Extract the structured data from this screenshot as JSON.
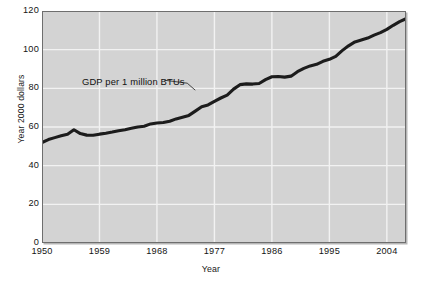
{
  "chart_data": {
    "type": "line",
    "title": "",
    "xlabel": "Year",
    "ylabel": "Year 2000 dollars",
    "xlim": [
      1950,
      2007
    ],
    "ylim": [
      0,
      120
    ],
    "grid": true,
    "legend": "none",
    "annotations": [
      {
        "text": "GDP per  1  million BTUs",
        "target_year": 1974,
        "target_value": 78
      }
    ],
    "xticks": [
      "1950",
      "1959",
      "1968",
      "1977",
      "1986",
      "1995",
      "2004"
    ],
    "xtick_values": [
      1950,
      1959,
      1968,
      1977,
      1986,
      1995,
      2004
    ],
    "yticks": [
      "0",
      "20",
      "40",
      "60",
      "80",
      "100",
      "120"
    ],
    "ytick_values": [
      0,
      20,
      40,
      60,
      80,
      100,
      120
    ],
    "series": [
      {
        "name": "GDP per 1 million BTUs",
        "color": "#1c1c1c",
        "x": [
          1950,
          1951,
          1952,
          1953,
          1954,
          1955,
          1956,
          1957,
          1958,
          1959,
          1960,
          1961,
          1962,
          1963,
          1964,
          1965,
          1966,
          1967,
          1968,
          1969,
          1970,
          1971,
          1972,
          1973,
          1974,
          1975,
          1976,
          1977,
          1978,
          1979,
          1980,
          1981,
          1982,
          1983,
          1984,
          1985,
          1986,
          1987,
          1988,
          1989,
          1990,
          1991,
          1992,
          1993,
          1994,
          1995,
          1996,
          1997,
          1998,
          1999,
          2000,
          2001,
          2002,
          2003,
          2004,
          2005,
          2006,
          2007
        ],
        "values": [
          52.0,
          53.5,
          54.5,
          55.5,
          56.3,
          58.6,
          56.6,
          55.8,
          55.7,
          56.3,
          56.8,
          57.4,
          58.1,
          58.6,
          59.3,
          60.0,
          60.4,
          61.6,
          62.1,
          62.3,
          63.0,
          64.2,
          65.1,
          66.0,
          68.2,
          70.5,
          71.4,
          73.3,
          75.0,
          76.5,
          79.6,
          81.9,
          82.3,
          82.2,
          82.5,
          84.5,
          86.0,
          86.1,
          85.8,
          86.3,
          88.6,
          90.3,
          91.6,
          92.4,
          94.0,
          95.0,
          96.5,
          99.5,
          102.0,
          104.0,
          105.0,
          106.0,
          107.5,
          108.8,
          110.5,
          112.6,
          114.5,
          116.0
        ]
      }
    ]
  },
  "axes": {
    "y_title": "Year 2000 dollars",
    "x_title": "Year"
  }
}
